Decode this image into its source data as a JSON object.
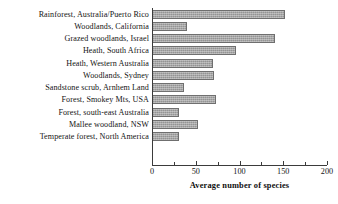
{
  "chart_data": {
    "type": "bar",
    "orientation": "horizontal",
    "title": "",
    "xlabel": "Average number of species",
    "ylabel": "",
    "xlim": [
      0,
      200
    ],
    "xticks": [
      0,
      50,
      100,
      150,
      200
    ],
    "xtick_labels": [
      "0",
      "50",
      "100",
      "150",
      "200"
    ],
    "minor_xticks": [
      25,
      75,
      125,
      175
    ],
    "grid": false,
    "legend": false,
    "bar_color": "#9d9d9d",
    "bar_edge_color": "#6f6f6f",
    "categories": [
      "Rainforest, Australia/Puerto Rico",
      "Woodlands, California",
      "Grazed woodlands, Israel",
      "Heath, South Africa",
      "Heath, Western Australia",
      "Woodlands, Sydney",
      "Sandstone scrub, Arnhem Land",
      "Forest, Smokey Mts, USA",
      "Forest, south-east Australia",
      "Mallee woodland, NSW",
      "Temperate forest, North America"
    ],
    "values": [
      152,
      40,
      140,
      96,
      70,
      71,
      36,
      73,
      31,
      52,
      31
    ]
  }
}
